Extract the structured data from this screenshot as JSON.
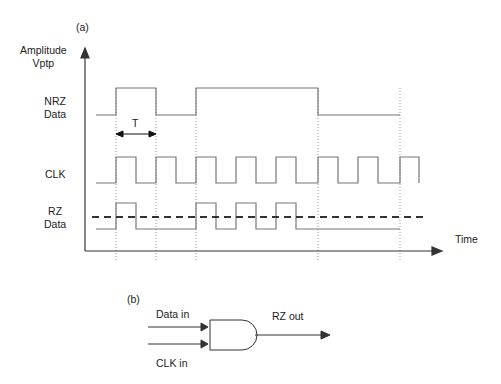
{
  "panel_a": {
    "label": "(a)",
    "y_axis_label_line1": "Amplitude",
    "y_axis_label_line2": "Vptp",
    "x_axis_label": "Time",
    "signals": {
      "nrz": {
        "line1": "NRZ",
        "line2": "Data"
      },
      "clk": {
        "line1": "CLK"
      },
      "rz": {
        "line1": "RZ",
        "line2": "Data"
      }
    },
    "period_label": "T"
  },
  "panel_b": {
    "label": "(b)",
    "input1_label": "Data in",
    "input2_label": "CLK in",
    "output_label": "RZ out",
    "gate": "AND"
  },
  "colors": {
    "signal": "#777777",
    "axis": "#333333",
    "dashed": "#333333",
    "text": "#222222"
  }
}
